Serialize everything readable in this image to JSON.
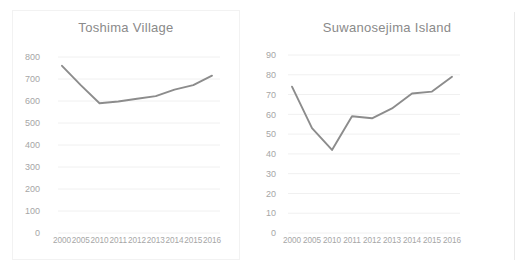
{
  "figure": {
    "background_color": "#ffffff",
    "panel_count": 2
  },
  "chart_data": [
    {
      "type": "line",
      "title": "Toshima Village",
      "xlabel": "",
      "ylabel": "",
      "categories": [
        "2000",
        "2005",
        "2010",
        "2011",
        "2012",
        "2013",
        "2014",
        "2015",
        "2016"
      ],
      "values": [
        760,
        672,
        590,
        598,
        610,
        622,
        652,
        672,
        715
      ],
      "series": [
        {
          "name": "Toshima Village",
          "values": [
            760,
            672,
            590,
            598,
            610,
            622,
            652,
            672,
            715
          ],
          "color": "#8c8c8c"
        }
      ],
      "ylim": [
        0,
        800
      ],
      "ytick_labels": [
        "800",
        "700",
        "600",
        "500",
        "400",
        "300",
        "200",
        "100",
        "0"
      ],
      "ytick_values": [
        800,
        700,
        600,
        500,
        400,
        300,
        200,
        100,
        0
      ],
      "ytick_step": 100,
      "grid": true,
      "grid_axis": "y",
      "legend": false,
      "legend_position": "none",
      "markers": false
    },
    {
      "type": "line",
      "title": "Suwanosejima Island",
      "xlabel": "",
      "ylabel": "",
      "categories": [
        "2000",
        "2005",
        "2010",
        "2011",
        "2012",
        "2013",
        "2014",
        "2015",
        "2016"
      ],
      "values": [
        74,
        53,
        42,
        59,
        58,
        63,
        70.5,
        71.5,
        79
      ],
      "series": [
        {
          "name": "Suwanosejima Island",
          "values": [
            74,
            53,
            42,
            59,
            58,
            63,
            70.5,
            71.5,
            79
          ],
          "color": "#8c8c8c"
        }
      ],
      "ylim": [
        0,
        90
      ],
      "ytick_labels": [
        "90",
        "80",
        "70",
        "60",
        "50",
        "40",
        "30",
        "20",
        "10",
        "0"
      ],
      "ytick_values": [
        90,
        80,
        70,
        60,
        50,
        40,
        30,
        20,
        10,
        0
      ],
      "ytick_step": 10,
      "grid": true,
      "grid_axis": "y",
      "legend": false,
      "legend_position": "none",
      "markers": false
    }
  ]
}
